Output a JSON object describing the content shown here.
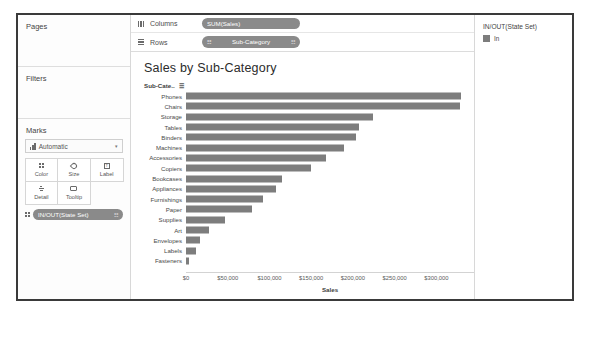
{
  "sidebar": {
    "pages": {
      "title": "Pages"
    },
    "filters": {
      "title": "Filters"
    },
    "marks": {
      "title": "Marks",
      "mark_type": "Automatic",
      "caret": "▾",
      "cards": [
        {
          "label": "Color",
          "icon": "color-icon"
        },
        {
          "label": "Size",
          "icon": "size-icon"
        },
        {
          "label": "Label",
          "icon": "label-icon"
        },
        {
          "label": "Detail",
          "icon": "detail-icon"
        },
        {
          "label": "Tooltip",
          "icon": "tooltip-icon"
        }
      ],
      "pill": {
        "text": "IN/OUT(State Set)",
        "tail": "☷"
      }
    }
  },
  "shelves": {
    "columns": {
      "label": "Columns",
      "pill": "SUM(Sales)"
    },
    "rows": {
      "label": "Rows",
      "pill": "Sub-Category",
      "prefix": "☷",
      "tail": "☷"
    }
  },
  "viz": {
    "title": "Sales by Sub-Category",
    "column_header": "Sub-Cate..",
    "sort_glyph": "☰"
  },
  "legend": {
    "title": "IN/OUT(State Set)",
    "items": [
      {
        "label": "In",
        "color": "#7d7d7d"
      }
    ]
  },
  "colors": {
    "bar": "#7d7d7d",
    "frame": "#3a3a3a",
    "pill": "#8a8a8a"
  },
  "chart_data": {
    "type": "bar",
    "orientation": "horizontal",
    "title": "Sales by Sub-Category",
    "xlabel": "Sales",
    "ylabel": "Sub-Category",
    "xlim": [
      0,
      345000
    ],
    "grid": false,
    "legend_position": "right",
    "tick_labels": [
      "$0",
      "$50,000",
      "$100,000",
      "$150,000",
      "$200,000",
      "$250,000",
      "$300,000"
    ],
    "tick_values": [
      0,
      50000,
      100000,
      150000,
      200000,
      250000,
      300000
    ],
    "categories": [
      "Phones",
      "Chairs",
      "Storage",
      "Tables",
      "Binders",
      "Machines",
      "Accessories",
      "Copiers",
      "Bookcases",
      "Appliances",
      "Furnishings",
      "Paper",
      "Supplies",
      "Art",
      "Envelopes",
      "Labels",
      "Fasteners"
    ],
    "values": [
      330007,
      328449,
      223844,
      206966,
      203413,
      189239,
      167380,
      149528,
      114880,
      107532,
      91705,
      78479,
      46674,
      27119,
      16476,
      12486,
      3024
    ],
    "series": [
      {
        "name": "In",
        "values": [
          330007,
          328449,
          223844,
          206966,
          203413,
          189239,
          167380,
          149528,
          114880,
          107532,
          91705,
          78479,
          46674,
          27119,
          16476,
          12486,
          3024
        ]
      }
    ]
  }
}
